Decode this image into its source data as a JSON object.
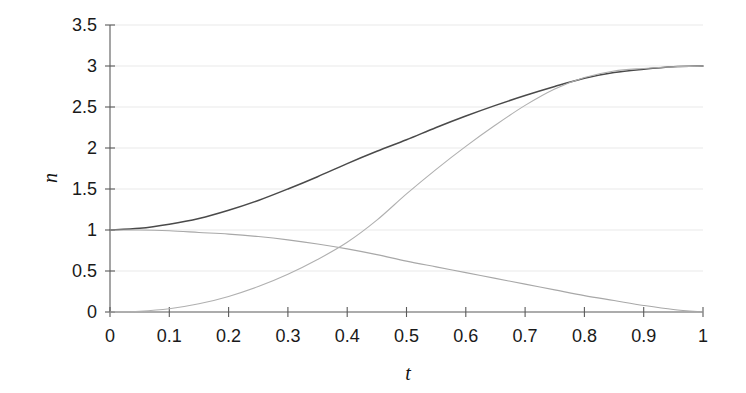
{
  "chart_data": {
    "type": "line",
    "title": "",
    "xlabel": "t",
    "ylabel": "n",
    "xlim": [
      0,
      1
    ],
    "ylim": [
      0,
      3.5
    ],
    "grid": true,
    "legend": "none",
    "x_ticks": [
      "0",
      "0.1",
      "0.2",
      "0.3",
      "0.4",
      "0.5",
      "0.6",
      "0.7",
      "0.8",
      "0.9",
      "1"
    ],
    "x_tick_values": [
      0,
      0.1,
      0.2,
      0.3,
      0.4,
      0.5,
      0.6,
      0.7,
      0.8,
      0.9,
      1
    ],
    "y_ticks": [
      "0",
      "0.5",
      "1",
      "1.5",
      "2",
      "2.5",
      "3",
      "3.5"
    ],
    "y_tick_values": [
      0,
      0.5,
      1,
      1.5,
      2,
      2.5,
      3,
      3.5
    ],
    "x": [
      0,
      0.05,
      0.1,
      0.15,
      0.2,
      0.25,
      0.3,
      0.35,
      0.4,
      0.45,
      0.5,
      0.55,
      0.6,
      0.65,
      0.7,
      0.75,
      0.8,
      0.85,
      0.9,
      0.95,
      1
    ],
    "series": [
      {
        "name": "total",
        "color": "#4a4a4a",
        "width": 1.5,
        "style": "solid",
        "values": [
          1.0,
          1.02,
          1.07,
          1.14,
          1.24,
          1.36,
          1.5,
          1.65,
          1.81,
          1.96,
          2.1,
          2.25,
          2.39,
          2.52,
          2.64,
          2.75,
          2.85,
          2.92,
          2.96,
          2.99,
          3.0
        ]
      },
      {
        "name": "decaying",
        "color": "#a8a8a8",
        "width": 1.1,
        "style": "solid",
        "values": [
          1.0,
          1.0,
          0.99,
          0.97,
          0.95,
          0.92,
          0.88,
          0.83,
          0.77,
          0.7,
          0.62,
          0.55,
          0.48,
          0.41,
          0.34,
          0.27,
          0.2,
          0.14,
          0.08,
          0.03,
          0.0
        ]
      },
      {
        "name": "rising",
        "color": "#b0b0b0",
        "width": 1.1,
        "style": "solid",
        "values": [
          0.0,
          0.01,
          0.04,
          0.1,
          0.19,
          0.31,
          0.46,
          0.64,
          0.85,
          1.12,
          1.44,
          1.74,
          2.02,
          2.28,
          2.52,
          2.72,
          2.86,
          2.94,
          2.97,
          2.99,
          3.0
        ]
      }
    ]
  },
  "axes": {
    "y_axis_title": "n",
    "x_axis_title": "t"
  }
}
